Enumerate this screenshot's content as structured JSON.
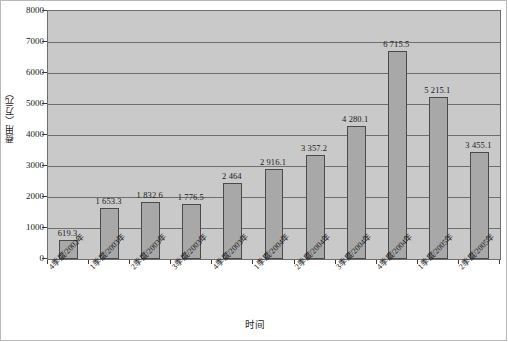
{
  "chart_data": {
    "type": "bar",
    "title": "",
    "xlabel": "时间",
    "ylabel": "费用（万元）",
    "ylim": [
      0,
      8000
    ],
    "ytick_values": [
      0,
      1000,
      2000,
      3000,
      4000,
      5000,
      6000,
      7000,
      8000
    ],
    "ytick_labels": [
      "0",
      "1000",
      "2000",
      "3000",
      "4000",
      "5000",
      "6000",
      "7000",
      "8000"
    ],
    "grid": true,
    "grid_axis": "y",
    "legend": false,
    "categories": [
      "4季度/2002年",
      "1季度/2003年",
      "2季度/2003年",
      "3季度/2003年",
      "4季度/2003年",
      "1季度/2004年",
      "2季度/2004年",
      "3季度/2004年",
      "4季度/2004年",
      "1季度/2005年",
      "2季度/2005年"
    ],
    "values": [
      619.3,
      1653.3,
      1832.6,
      1776.5,
      2464,
      2916.1,
      3357.2,
      4280.1,
      6715.5,
      5215.1,
      3455.1
    ],
    "value_labels": [
      "619.3",
      "1 653.3",
      "1 832.6",
      "1 776.5",
      "2 464",
      "2 916.1",
      "3 357.2",
      "4 280.1",
      "6 715.5",
      "5 215.1",
      "3 455.1"
    ],
    "colors": {
      "bar_fill": "#a8a8a8",
      "bar_edge": "#4a4a4a",
      "plot_background": "#c9c9c9",
      "gridline": "#6e6e6e",
      "page_background": "#ffffff",
      "frame_border": "#b9b9b9",
      "text": "#1a1a1a"
    }
  }
}
